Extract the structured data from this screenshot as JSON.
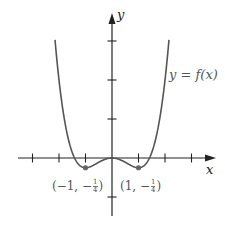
{
  "chart_data": {
    "type": "line",
    "title": "",
    "function": "f(x) = (x^4 - 2x^2)/4",
    "xlabel": "x",
    "ylabel": "y",
    "curve_label": "y = f(x)",
    "x_ticks": [
      -3,
      -2,
      -1,
      1,
      2,
      3
    ],
    "y_ticks": [
      -1,
      1,
      2,
      3
    ],
    "xlim": [
      -4.1,
      3.9
    ],
    "ylim": [
      -1.5,
      3.7
    ],
    "tick_labels_shown": false,
    "grid": false,
    "series": [
      {
        "name": "y = f(x)",
        "x": [
          -2.15,
          -2.0,
          -1.75,
          -1.5,
          -1.25,
          -1.0,
          -0.75,
          -0.5,
          -0.25,
          0,
          0.25,
          0.5,
          0.75,
          1.0,
          1.25,
          1.5,
          1.75,
          2.0,
          2.15
        ],
        "y": [
          3.03,
          2.0,
          0.81,
          0.14,
          -0.17,
          -0.25,
          -0.18,
          -0.11,
          -0.03,
          0,
          -0.03,
          -0.11,
          -0.18,
          -0.25,
          -0.17,
          0.14,
          0.81,
          2.0,
          3.03
        ]
      }
    ],
    "annotations": [
      {
        "x": -1,
        "y": -0.25,
        "text": "(−1, −1/4)",
        "marker": "dot"
      },
      {
        "x": 1,
        "y": -0.25,
        "text": "(1, −1/4)",
        "marker": "dot"
      }
    ]
  },
  "labels": {
    "y_axis": "y",
    "x_axis": "x",
    "curve": "y = f(x)",
    "left_point_pre": "(−1, −",
    "right_point_pre": "(1, −",
    "frac_num": "1",
    "frac_den": "4",
    "close_paren": ")"
  },
  "plot": {
    "origin_px": [
      112,
      158
    ],
    "x_scale_px": 26.5,
    "y_scale_px": 39,
    "colors": {
      "axis": "#222222",
      "curve": "#555555",
      "points": "#666666",
      "background": "#ffffff"
    }
  }
}
